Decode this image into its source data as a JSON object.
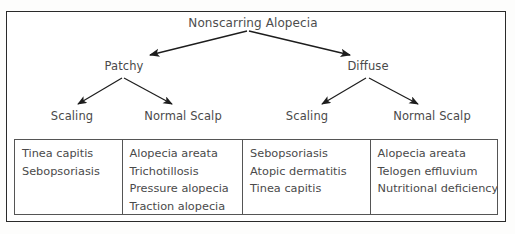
{
  "diagram": {
    "type": "tree",
    "root": {
      "label": "Nonscarring Alopecia"
    },
    "level2": [
      {
        "label": "Patchy"
      },
      {
        "label": "Diffuse"
      }
    ],
    "level3": [
      {
        "label": "Scaling"
      },
      {
        "label": "Normal Scalp"
      },
      {
        "label": "Scaling"
      },
      {
        "label": "Normal Scalp"
      }
    ],
    "columns": [
      {
        "parent": "Patchy / Scaling",
        "items": [
          "Tinea capitis",
          "Sebopsoriasis"
        ]
      },
      {
        "parent": "Patchy / Normal Scalp",
        "items": [
          "Alopecia areata",
          "Trichotillosis",
          "Pressure alopecia",
          "Traction alopecia"
        ]
      },
      {
        "parent": "Diffuse / Scaling",
        "items": [
          "Sebopsoriasis",
          "Atopic dermatitis",
          "Tinea capitis"
        ]
      },
      {
        "parent": "Diffuse / Normal Scalp",
        "items": [
          "Alopecia areata",
          "Telogen effluvium",
          "Nutritional deficiency"
        ]
      }
    ],
    "colors": {
      "text": "#4a4a4a",
      "frame": "#2a2a2a",
      "cell_border": "#555555",
      "arrow": "#1d1d1d",
      "background": "#ffffff"
    }
  }
}
